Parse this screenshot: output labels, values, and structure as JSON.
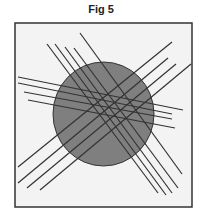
{
  "figure": {
    "title": "Fig 5",
    "colors": {
      "background": "#f3f3f3",
      "frame": "#333333",
      "circle_fill": "#7f7f7f",
      "circle_stroke": "#333333",
      "line": "#333333"
    },
    "frame": {
      "x": 15,
      "y": 23,
      "width": 177,
      "height": 184
    },
    "circle": {
      "cx": 103.5,
      "cy": 114,
      "rx": 50.5,
      "ry": 52
    },
    "line_bundles": [
      {
        "name": "nw-se",
        "lines": [
          [
            47,
            44,
            158,
            193
          ],
          [
            55,
            44,
            166,
            195
          ],
          [
            65,
            47,
            172,
            193
          ],
          [
            74,
            48,
            178,
            188
          ],
          [
            80,
            33,
            182,
            174
          ]
        ]
      },
      {
        "name": "horizontal",
        "lines": [
          [
            18,
            77,
            183,
            110
          ],
          [
            18,
            83,
            172,
            114
          ],
          [
            24,
            92,
            172,
            119
          ],
          [
            28,
            100,
            175,
            128
          ]
        ]
      },
      {
        "name": "ne-sw",
        "lines": [
          [
            172,
            42,
            18,
            167
          ],
          [
            168,
            58,
            18,
            183
          ],
          [
            176,
            64,
            27,
            188
          ],
          [
            191,
            64,
            40,
            190
          ]
        ]
      }
    ]
  }
}
